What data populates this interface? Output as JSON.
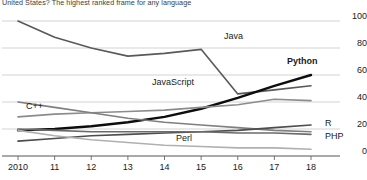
{
  "caption": {
    "text": "United States? The highest ranked frame for any language"
  },
  "chart_data": {
    "type": "line",
    "title": "",
    "subtitle": "",
    "xlabel": "",
    "ylabel": "",
    "x": [
      2010,
      2011,
      2012,
      2013,
      2014,
      2015,
      2016,
      2017,
      2018
    ],
    "xtick_labels": [
      "2010",
      "11",
      "12",
      "13",
      "14",
      "15",
      "16",
      "17",
      "18"
    ],
    "ytick_labels": [
      "100",
      "80",
      "60",
      "40",
      "20",
      "0"
    ],
    "ytick_values": [
      100,
      80,
      60,
      40,
      20,
      0
    ],
    "ylim": [
      0,
      100
    ],
    "xlim": [
      2010,
      2018
    ],
    "grid": true,
    "grid_axis": "y",
    "legend_position": "inline-labels",
    "series": [
      {
        "name": "Java",
        "label": "Java",
        "color": "#595959",
        "width": 1.6,
        "bold_label": false,
        "values": [
          100,
          88,
          80,
          74,
          76,
          79,
          46,
          49,
          52
        ]
      },
      {
        "name": "Python",
        "label": "Python",
        "color": "#0d0d0d",
        "width": 2.4,
        "bold_label": true,
        "values": [
          19,
          20,
          22,
          25,
          29,
          35,
          43,
          52,
          60
        ]
      },
      {
        "name": "JavaScript",
        "label": "JavaScript",
        "color": "#8c8c8c",
        "width": 1.6,
        "bold_label": false,
        "values": [
          29,
          31,
          32,
          33,
          34,
          36,
          38,
          42,
          41
        ]
      },
      {
        "name": "C++",
        "label": "C++",
        "color": "#7f7f7f",
        "width": 1.6,
        "bold_label": false,
        "values": [
          40,
          36,
          32,
          28,
          25,
          23,
          21,
          19,
          18
        ]
      },
      {
        "name": "R",
        "label": "R",
        "color": "#4d4d4d",
        "width": 1.6,
        "bold_label": false,
        "values": [
          11,
          13,
          15,
          16,
          17,
          18,
          19,
          21,
          23
        ]
      },
      {
        "name": "PHP",
        "label": "PHP",
        "color": "#6b6b6b",
        "width": 1.6,
        "bold_label": false,
        "values": [
          20,
          19,
          18,
          18,
          18,
          18,
          17,
          17,
          16
        ]
      },
      {
        "name": "Perl",
        "label": "Perl",
        "color": "#b0b0b0",
        "width": 1.6,
        "bold_label": false,
        "values": [
          19,
          15,
          12,
          10,
          8,
          7,
          6,
          6,
          5
        ]
      }
    ],
    "annotations": [
      {
        "text": "Java",
        "x": 224,
        "y": 31
      },
      {
        "text": "Python",
        "x": 287,
        "y": 56
      },
      {
        "text": "JavaScript",
        "x": 152,
        "y": 77
      },
      {
        "text": "C++",
        "x": 26,
        "y": 101
      },
      {
        "text": "R",
        "x": 325,
        "y": 118
      },
      {
        "text": "PHP",
        "x": 325,
        "y": 131
      },
      {
        "text": "Perl",
        "x": 176,
        "y": 133
      }
    ]
  }
}
